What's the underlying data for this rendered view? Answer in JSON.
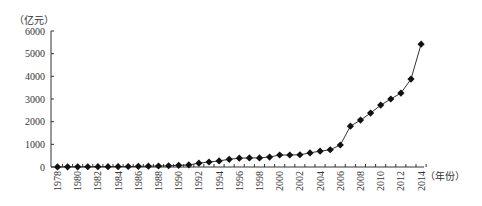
{
  "chart_data": {
    "type": "line",
    "title": "",
    "xlabel": "（年份）",
    "ylabel": "（亿元）",
    "ylim": [
      0,
      6000
    ],
    "yticks": [
      0,
      1000,
      2000,
      3000,
      4000,
      5000,
      6000
    ],
    "xtick_labels": [
      "1978",
      "1980",
      "1982",
      "1984",
      "1986",
      "1988",
      "1990",
      "1992",
      "1994",
      "1996",
      "1998",
      "2000",
      "2002",
      "2004",
      "2006",
      "2008",
      "2010",
      "2012",
      "2014"
    ],
    "grid": false,
    "legend": null,
    "marker": "diamond",
    "x": [
      1978,
      1979,
      1980,
      1981,
      1982,
      1983,
      1984,
      1985,
      1986,
      1987,
      1988,
      1989,
      1990,
      1991,
      1992,
      1993,
      1994,
      1995,
      1996,
      1997,
      1998,
      1999,
      2000,
      2001,
      2002,
      2003,
      2004,
      2005,
      2006,
      2007,
      2008,
      2009,
      2010,
      2011,
      2012,
      2013,
      2014
    ],
    "series": [
      {
        "name": "",
        "values": [
          5,
          7,
          9,
          11,
          13,
          15,
          18,
          22,
          28,
          35,
          45,
          55,
          75,
          90,
          170,
          220,
          270,
          340,
          390,
          400,
          400,
          440,
          530,
          530,
          540,
          620,
          700,
          760,
          970,
          1800,
          2070,
          2380,
          2730,
          3000,
          3260,
          3880,
          5420
        ]
      }
    ]
  }
}
